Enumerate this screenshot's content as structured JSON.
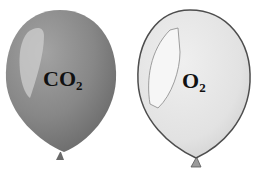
{
  "balloons": [
    {
      "gas": "CO",
      "subscript": "2",
      "fill": "#8a8a8a",
      "shade": "#6f6f6f",
      "highlight": "#c8c8c8",
      "outline": "#7a7a7a"
    },
    {
      "gas": "O",
      "subscript": "2",
      "fill": "#e6e6e6",
      "shade": "#d4d4d4",
      "highlight": "#f5f5f5",
      "outline": "#555555"
    }
  ]
}
